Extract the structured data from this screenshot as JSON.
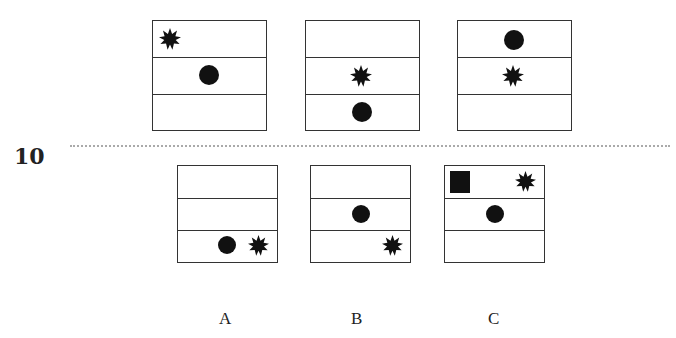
{
  "question_number": "10",
  "option_labels": [
    "A",
    "B",
    "C"
  ],
  "colors": {
    "ink": "#111111",
    "border": "#333333",
    "dots": "#aaaaaa"
  },
  "sequence": [
    {
      "rows": [
        [
          "star-left"
        ],
        [
          "circle-center"
        ],
        []
      ]
    },
    {
      "rows": [
        [],
        [
          "star-center"
        ],
        [
          "circle-center"
        ]
      ]
    },
    {
      "rows": [
        [
          "circle-center"
        ],
        [
          "star-center"
        ],
        []
      ]
    }
  ],
  "options": [
    {
      "label": "A",
      "rows": [
        [],
        [],
        [
          "circle",
          "star-right"
        ]
      ]
    },
    {
      "label": "B",
      "rows": [
        [],
        [
          "circle-center"
        ],
        [
          "star-right"
        ]
      ]
    },
    {
      "label": "C",
      "rows": [
        [
          "square-left",
          "star-right"
        ],
        [
          "circle-center"
        ],
        []
      ]
    }
  ]
}
